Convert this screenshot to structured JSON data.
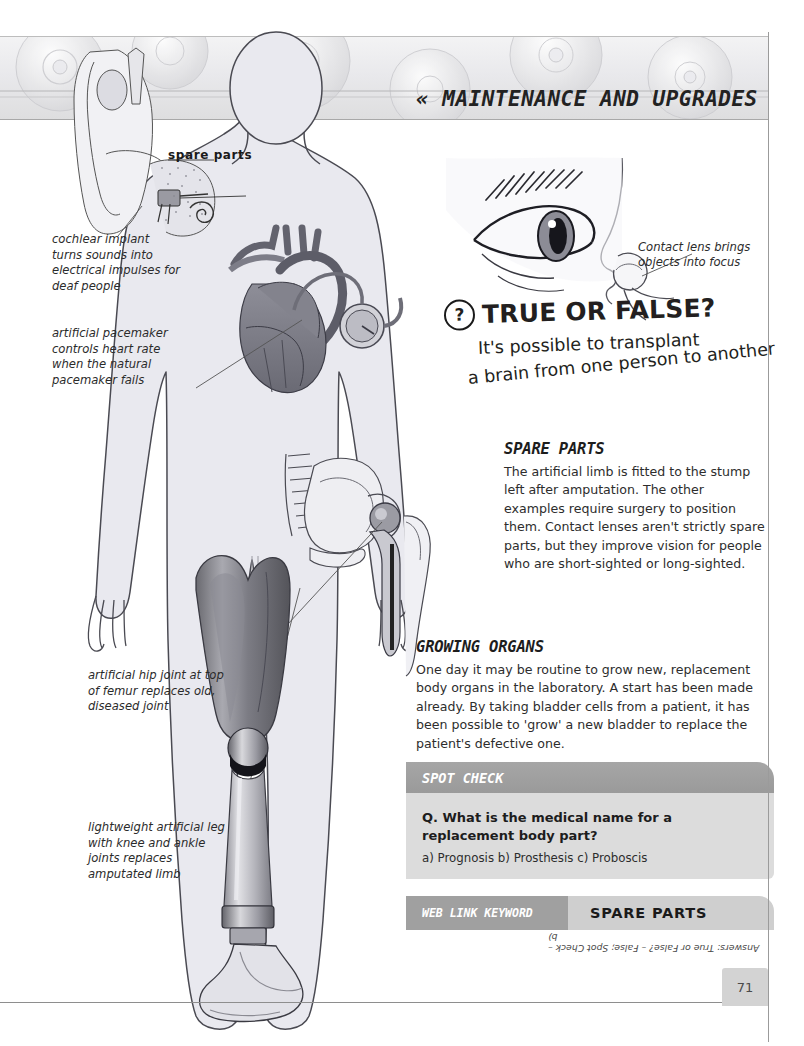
{
  "banner": {
    "title": "« MAINTENANCE AND UPGRADES »"
  },
  "callouts": {
    "spare_parts_label": "spare parts",
    "cochlear": "cochlear implant turns sounds into electrical impulses for deaf people",
    "pacemaker": "artificial pacemaker controls heart rate when the natural pacemaker fails",
    "hip": "artificial hip joint at top of femur replaces old, diseased joint",
    "leg": "lightweight artificial leg with knee and ankle joints replaces amputated limb",
    "contact_lens": "Contact lens brings objects into focus"
  },
  "true_or_false": {
    "question_mark": "?",
    "title": "TRUE OR FALSE?",
    "line1": "It's possible to transplant",
    "line2": "a brain from one person to another"
  },
  "sections": [
    {
      "heading": "SPARE PARTS",
      "body": "The artificial limb is fitted to the stump left after amputation. The other examples require surgery to position them. Contact lenses aren't strictly spare parts, but they improve vision for people who are short-sighted or long-sighted."
    },
    {
      "heading": "GROWING ORGANS",
      "body": "One day it may be routine to grow new, replacement body organs in the laboratory. A start has been made already. By taking bladder cells from a patient, it has been possible to 'grow' a new bladder to replace the patient's defective one."
    }
  ],
  "spot_check": {
    "heading": "SPOT CHECK",
    "question": "Q. What is the medical name for a replacement body part?",
    "options": "a) Prognosis b) Prosthesis c) Proboscis"
  },
  "web_link": {
    "label": "WEB LINK KEYWORD",
    "keyword": "SPARE PARTS"
  },
  "answers": "Answers: True or False? – False; Spot Check – b)",
  "page_number": "71",
  "colors": {
    "banner_light": "#f3f3f4",
    "banner_dark": "#dededf",
    "spotcheck_header": "#a6a6a6",
    "spotcheck_body": "#dcdcdc",
    "weblink_left": "#a0a0a0",
    "weblink_right": "#cfcfcf",
    "body_silhouette": "#e8e8ee",
    "prosthetic_socket": "#6e6e72",
    "text": "#231f20"
  }
}
